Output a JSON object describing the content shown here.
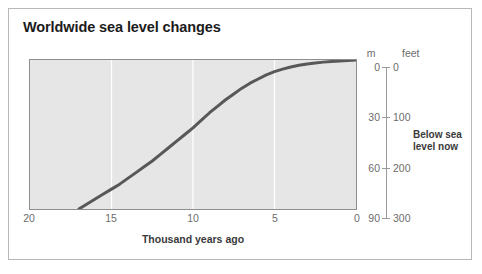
{
  "chart_data": {
    "type": "line",
    "title": "Worldwide sea level changes",
    "xlabel": "Thousand years ago",
    "ylabel": "m",
    "secondary_ylabel": "feet",
    "xlim": [
      20,
      0
    ],
    "ylim": [
      90,
      0
    ],
    "secondary_ylim": [
      300,
      0
    ],
    "x_reversed": true,
    "grid": "vertical-only",
    "legend": "none",
    "annotations": [
      {
        "text": "Below sea level now",
        "position": "right-of-axis"
      }
    ],
    "x_ticks": [
      {
        "value": 20,
        "label": "20"
      },
      {
        "value": 15,
        "label": "15"
      },
      {
        "value": 10,
        "label": "10"
      },
      {
        "value": 5,
        "label": "5"
      },
      {
        "value": 0,
        "label": "0"
      }
    ],
    "y_ticks_m": [
      {
        "value": 0,
        "label": "0"
      },
      {
        "value": 30,
        "label": "30"
      },
      {
        "value": 60,
        "label": "60"
      },
      {
        "value": 90,
        "label": "90"
      }
    ],
    "y_ticks_feet": [
      {
        "value": 0,
        "label": "0"
      },
      {
        "value": 100,
        "label": "100"
      },
      {
        "value": 200,
        "label": "200"
      },
      {
        "value": 300,
        "label": "300"
      }
    ],
    "series": [
      {
        "name": "Sea level",
        "x": [
          17.0,
          16.5,
          16.0,
          15.5,
          15.0,
          14.5,
          14.0,
          13.5,
          13.0,
          12.5,
          12.0,
          11.5,
          11.0,
          10.5,
          10.0,
          9.5,
          9.0,
          8.5,
          8.0,
          7.5,
          7.0,
          6.5,
          6.0,
          5.5,
          5.0,
          4.5,
          4.0,
          3.5,
          3.0,
          2.5,
          2.0,
          1.5,
          1.0,
          0.5,
          0.0
        ],
        "values": [
          90.0,
          87.0,
          84.0,
          81.0,
          78.0,
          75.0,
          71.5,
          68.0,
          64.5,
          61.0,
          57.0,
          53.0,
          49.0,
          45.0,
          41.0,
          36.5,
          32.0,
          28.0,
          24.0,
          20.5,
          17.0,
          14.0,
          11.5,
          9.0,
          7.0,
          5.5,
          4.2,
          3.2,
          2.4,
          1.8,
          1.3,
          0.9,
          0.6,
          0.3,
          0.0
        ],
        "units": "m below present sea level",
        "color": "#585858"
      }
    ]
  },
  "figure": {
    "title": "Worldwide sea level changes",
    "plot_background": "#e6e6e6",
    "border_color": "#b8b8b8",
    "line_color": "#585858",
    "tick_label_color": "#6d6d6d",
    "gridline_color": "#ffffff"
  },
  "axes": {
    "x": {
      "title": "Thousand years ago",
      "tick_labels": [
        "20",
        "15",
        "10",
        "5",
        "0"
      ]
    },
    "y_left_unit": "m",
    "y_right_unit": "feet",
    "y_m_labels": [
      "0",
      "30",
      "60",
      "90"
    ],
    "y_feet_labels": [
      "0",
      "100",
      "200",
      "300"
    ]
  },
  "annotation": {
    "line1": "Below sea",
    "line2": "level now"
  }
}
